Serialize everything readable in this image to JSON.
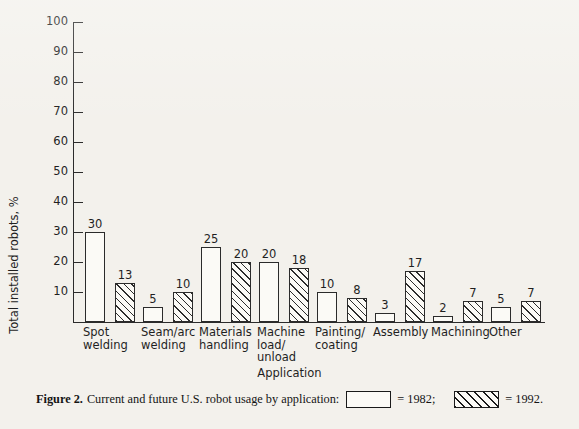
{
  "chart_data": {
    "type": "bar",
    "title": "",
    "xlabel": "Application",
    "ylabel": "Total installed robots, %",
    "ylim": [
      0,
      100
    ],
    "yticks": [
      10,
      20,
      30,
      40,
      50,
      60,
      70,
      80,
      90,
      100
    ],
    "ytick_labels": [
      "10",
      "20",
      "30",
      "40",
      "50",
      "60",
      "70",
      "80",
      "90",
      "100"
    ],
    "grid": false,
    "legend_position": "caption",
    "categories": [
      "Spot\nwelding",
      "Seam/arc\nwelding",
      "Materials\nhandling",
      "Machine\nload/\nunload",
      "Painting/\ncoating",
      "Assembly",
      "Machining",
      "Other"
    ],
    "series": [
      {
        "name": "1982",
        "fill": "open",
        "values": [
          30,
          5,
          25,
          20,
          10,
          3,
          2,
          5
        ]
      },
      {
        "name": "1992",
        "fill": "hatched",
        "values": [
          13,
          10,
          20,
          18,
          8,
          17,
          7,
          7
        ]
      }
    ]
  },
  "caption": {
    "figure_number": "Figure 2.",
    "text": "Current and future U.S. robot usage by application:",
    "legend": [
      {
        "equals": "= 1982;",
        "series": "1982",
        "fill": "open"
      },
      {
        "equals": "= 1992.",
        "series": "1992",
        "fill": "hatched"
      }
    ]
  },
  "colors": {
    "ink": "#2b2b2b",
    "paper": "#f3f1ec",
    "bar_fill": "#fbfaf6"
  }
}
